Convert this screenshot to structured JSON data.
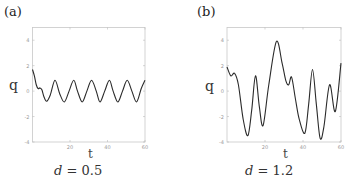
{
  "chart_data": [
    {
      "type": "line",
      "panel": "(a)",
      "title": "",
      "caption": {
        "var": "d",
        "eq": " = ",
        "value": "0.5"
      },
      "xlabel": "t",
      "ylabel": "q",
      "xlim": [
        0,
        60
      ],
      "ylim": [
        -4,
        5
      ],
      "xticks": [
        20,
        40,
        60
      ],
      "yticks": [
        -4,
        -2,
        0,
        2,
        4
      ],
      "grid": false,
      "series": [
        {
          "name": "q(t)",
          "x": [
            0,
            1,
            2,
            3,
            4,
            5,
            6,
            7.5,
            9.5,
            12,
            14.5,
            17,
            19.5,
            22,
            24,
            26.5,
            29,
            31.5,
            34,
            36,
            38.5,
            41,
            43,
            45.5,
            48,
            50.5,
            53,
            55.5,
            58,
            60
          ],
          "y": [
            1.7,
            1.2,
            0.5,
            0.2,
            0.25,
            0.1,
            -0.4,
            -0.8,
            -0.3,
            0.85,
            -0.2,
            -0.85,
            0.0,
            0.85,
            0.0,
            -0.85,
            0.0,
            0.85,
            0.0,
            -0.85,
            0.0,
            0.85,
            0.0,
            -0.85,
            0.0,
            0.85,
            0.0,
            -0.85,
            0.2,
            0.85
          ]
        }
      ]
    },
    {
      "type": "line",
      "panel": "(b)",
      "title": "",
      "caption": {
        "var": "d",
        "eq": " = ",
        "value": "1.2"
      },
      "xlabel": "t",
      "ylabel": "q",
      "xlim": [
        0,
        60
      ],
      "ylim": [
        -4,
        5
      ],
      "xticks": [
        20,
        40,
        60
      ],
      "yticks": [
        -4,
        -2,
        0,
        2,
        4
      ],
      "grid": false,
      "series": [
        {
          "name": "q(t)",
          "x": [
            0,
            2,
            4,
            6,
            8.5,
            11,
            13,
            15,
            17,
            19,
            22,
            26,
            29,
            31,
            32.5,
            34,
            36,
            38,
            41,
            43,
            45,
            47,
            49,
            51,
            54,
            57,
            60
          ],
          "y": [
            1.9,
            1.2,
            1.4,
            0.5,
            -2.2,
            -3.5,
            -1.5,
            1.2,
            -1.2,
            -2.7,
            0.5,
            3.9,
            2.2,
            0.8,
            0.5,
            1.1,
            -0.6,
            -2.2,
            -3.3,
            -1.0,
            1.7,
            -1.0,
            -3.7,
            -2.8,
            0.5,
            -1.6,
            2.2
          ]
        }
      ]
    }
  ],
  "panels": [
    {
      "label": "(a)",
      "ylabel": "q",
      "xlabel": "t",
      "caption_var": "d",
      "caption_eq": "=",
      "caption_val": "0.5"
    },
    {
      "label": "(b)",
      "ylabel": "q",
      "xlabel": "t",
      "caption_var": "d",
      "caption_eq": "=",
      "caption_val": "1.2"
    }
  ]
}
